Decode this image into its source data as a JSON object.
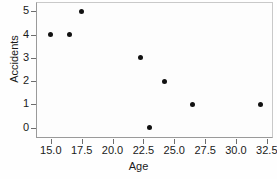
{
  "chart_data": {
    "type": "scatter",
    "title": "",
    "xlabel": "Age",
    "ylabel": "Accidents",
    "x": [
      15.0,
      16.5,
      17.5,
      22.3,
      23.0,
      24.2,
      26.5,
      32.0
    ],
    "y": [
      4,
      4,
      5,
      3,
      0,
      2,
      1,
      1
    ],
    "points": [
      {
        "x": 15.0,
        "y": 4
      },
      {
        "x": 16.5,
        "y": 4
      },
      {
        "x": 17.5,
        "y": 5
      },
      {
        "x": 22.3,
        "y": 3
      },
      {
        "x": 23.0,
        "y": 0
      },
      {
        "x": 24.2,
        "y": 2
      },
      {
        "x": 26.5,
        "y": 1
      },
      {
        "x": 32.0,
        "y": 1
      }
    ],
    "xlim": [
      13.8,
      33.0
    ],
    "ylim": [
      -0.45,
      5.4
    ],
    "xticks": [
      15.0,
      17.5,
      20.0,
      22.5,
      25.0,
      27.5,
      30.0,
      32.5
    ],
    "xticklabels": [
      "15.0",
      "17.5",
      "20.0",
      "22.5",
      "25.0",
      "27.5",
      "30.0",
      "32.5"
    ],
    "yticks": [
      0,
      1,
      2,
      3,
      4,
      5
    ],
    "yticklabels": [
      "0",
      "1",
      "2",
      "3",
      "4",
      "5"
    ],
    "grid": false,
    "legend": null,
    "marker": "filled-circle",
    "marker_color": "#111111",
    "background_color": "#fdfdfd",
    "axis_color": "#9a9a9a"
  }
}
